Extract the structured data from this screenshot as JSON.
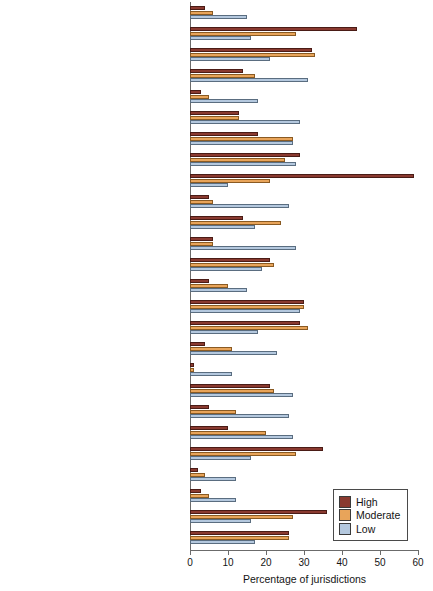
{
  "chart_data": {
    "type": "bar",
    "orientation": "horizontal",
    "title": "",
    "xlabel": "Percentage of jurisdictions",
    "ylabel": "",
    "xlim": [
      0,
      60
    ],
    "xticks": [
      0,
      10,
      20,
      30,
      40,
      50,
      60
    ],
    "grid": false,
    "legend_position": "bottom-right",
    "categories": [
      "Alien smuggling",
      "Assault",
      "Burglary",
      "Check fraud",
      "Child sex trafficking",
      "Counterfeiting",
      "Credit card fraud",
      "Large-scale drug distribution",
      "Street-level drug sales",
      "Extortion",
      "Fencing stolen goods",
      "Hate crimes/civil rights violations",
      "Homicide",
      "Human trafficking",
      "Identity theft",
      "Larceny/theft",
      "Money laundering",
      "Mortgage fraud",
      "Motor vehicle theft",
      "Prescription fraud",
      "Prostitution",
      "Robbery",
      "Social security fraud",
      "Tax fraud",
      "Threats/intimidation",
      "Weapons trafficking"
    ],
    "series": [
      {
        "name": "High",
        "color": "#8a3a30",
        "values": [
          4,
          44,
          32,
          14,
          3,
          13,
          18,
          29,
          59,
          5,
          14,
          6,
          21,
          5,
          30,
          29,
          4,
          1,
          21,
          5,
          10,
          35,
          2,
          3,
          36,
          26
        ]
      },
      {
        "name": "Moderate",
        "color": "#e8a45a",
        "values": [
          6,
          28,
          33,
          17,
          5,
          13,
          27,
          25,
          21,
          6,
          24,
          6,
          22,
          10,
          30,
          31,
          11,
          1,
          22,
          12,
          20,
          28,
          4,
          5,
          27,
          26
        ]
      },
      {
        "name": "Low",
        "color": "#b4c8de",
        "values": [
          15,
          16,
          21,
          31,
          18,
          29,
          27,
          28,
          10,
          26,
          17,
          28,
          19,
          15,
          29,
          18,
          23,
          11,
          27,
          26,
          27,
          16,
          12,
          12,
          16,
          17
        ]
      }
    ]
  },
  "legend": {
    "items": [
      {
        "label": "High"
      },
      {
        "label": "Moderate"
      },
      {
        "label": "Low"
      }
    ]
  }
}
